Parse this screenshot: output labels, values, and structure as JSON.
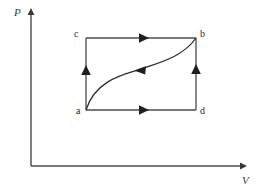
{
  "figure": {
    "kind": "pv-cycle-diagram",
    "stroke_color": "#4a4a4a",
    "curve_color": "#2b2b2b",
    "background": "#ffffff"
  },
  "axes": {
    "vertical": {
      "label": "P",
      "name": "pressure-axis"
    },
    "horizontal": {
      "label": "V",
      "name": "volume-axis"
    }
  },
  "points": {
    "a": {
      "label": "a"
    },
    "b": {
      "label": "b"
    },
    "c": {
      "label": "c"
    },
    "d": {
      "label": "d"
    }
  },
  "paths": {
    "top_edge": {
      "from": "c",
      "to": "b",
      "arrow": "right"
    },
    "bottom_edge": {
      "from": "a",
      "to": "d",
      "arrow": "right"
    },
    "left_edge": {
      "from": "a",
      "to": "c",
      "arrow": "up"
    },
    "right_edge": {
      "from": "d",
      "to": "b",
      "arrow": "up"
    },
    "curve": {
      "from": "b",
      "to": "a",
      "arrow": "left"
    }
  }
}
